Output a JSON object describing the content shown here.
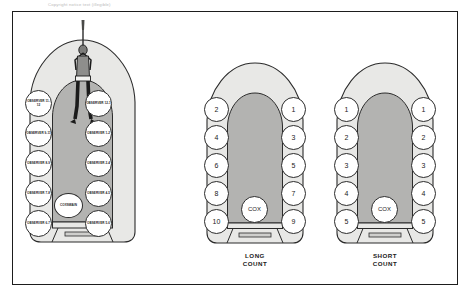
{
  "page": {
    "top_caption": "Copyright notice text (illegible)",
    "border_color": "#1d1d1d",
    "hull_fill": "#e8e8e6",
    "deck_fill": "#b3b3b1",
    "seat_fill": "#ffffff",
    "ink": "#1b1b1b"
  },
  "diagrams": [
    {
      "id": "observer-boat",
      "name": "observer-positions",
      "caption": "",
      "cox_label": "COXSWAIN",
      "left_seats": [
        {
          "label": "OBSERVER 11-12"
        },
        {
          "label": "OBSERVER 9-11"
        },
        {
          "label": "OBSERVER 8-9"
        },
        {
          "label": "OBSERVER 7-8"
        },
        {
          "label": "OBSERVER 6-7"
        }
      ],
      "right_seats": [
        {
          "label": "OBSERVER 12-1"
        },
        {
          "label": "OBSERVER 1-2"
        },
        {
          "label": "OBSERVER 2-4"
        },
        {
          "label": "OBSERVER 4-5"
        },
        {
          "label": "OBSERVER 5-6"
        }
      ],
      "has_paddler_figure": true
    },
    {
      "id": "long-count-boat",
      "name": "long-count",
      "caption": "LONG\nCOUNT",
      "caption_line1": "LONG",
      "caption_line2": "COUNT",
      "cox_label": "COX",
      "left_seats": [
        {
          "label": "2"
        },
        {
          "label": "4"
        },
        {
          "label": "6"
        },
        {
          "label": "8"
        },
        {
          "label": "10"
        }
      ],
      "right_seats": [
        {
          "label": "1"
        },
        {
          "label": "3"
        },
        {
          "label": "5"
        },
        {
          "label": "7"
        },
        {
          "label": "9"
        }
      ],
      "has_paddler_figure": false
    },
    {
      "id": "short-count-boat",
      "name": "short-count",
      "caption": "SHORT\nCOUNT",
      "caption_line1": "SHORT",
      "caption_line2": "COUNT",
      "cox_label": "COX",
      "left_seats": [
        {
          "label": "1"
        },
        {
          "label": "2"
        },
        {
          "label": "3"
        },
        {
          "label": "4"
        },
        {
          "label": "5"
        }
      ],
      "right_seats": [
        {
          "label": "1"
        },
        {
          "label": "2"
        },
        {
          "label": "3"
        },
        {
          "label": "4"
        },
        {
          "label": "5"
        }
      ],
      "has_paddler_figure": false
    }
  ]
}
